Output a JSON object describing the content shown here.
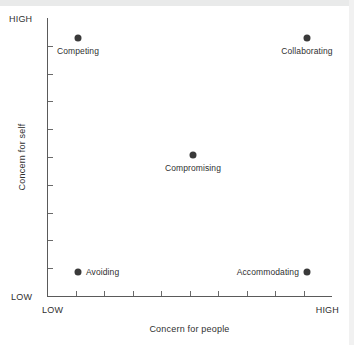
{
  "chart_data": {
    "type": "scatter",
    "title": "",
    "xlabel": "Concern for people",
    "ylabel": "Concern for self",
    "xlim": [
      0,
      10
    ],
    "ylim": [
      0,
      10
    ],
    "x_tick_labels": [
      "LOW",
      "HIGH"
    ],
    "y_tick_labels": [
      "LOW",
      "HIGH"
    ],
    "x_tick_count": 9,
    "y_tick_count": 9,
    "grid": false,
    "legend": "none",
    "point_color": "#3a3a3a",
    "axis_color": "#5a5a5a",
    "points": [
      {
        "label": "Competing",
        "x": 1,
        "y": 9,
        "px": 78,
        "py": 38,
        "label_pos": "below"
      },
      {
        "label": "Collaborating",
        "x": 9,
        "y": 9,
        "px": 307,
        "py": 38,
        "label_pos": "below"
      },
      {
        "label": "Compromising",
        "x": 5,
        "y": 5,
        "px": 193,
        "py": 155,
        "label_pos": "below"
      },
      {
        "label": "Avoiding",
        "x": 1,
        "y": 1,
        "px": 78,
        "py": 272,
        "label_pos": "right"
      },
      {
        "label": "Accommodating",
        "x": 9,
        "y": 1,
        "px": 307,
        "py": 272,
        "label_pos": "left"
      }
    ]
  },
  "axis_text": {
    "y_high": "HIGH",
    "y_low": "LOW",
    "x_low": "LOW",
    "x_high": "HIGH",
    "y_title": "Concern for self",
    "x_title": "Concern for people"
  }
}
